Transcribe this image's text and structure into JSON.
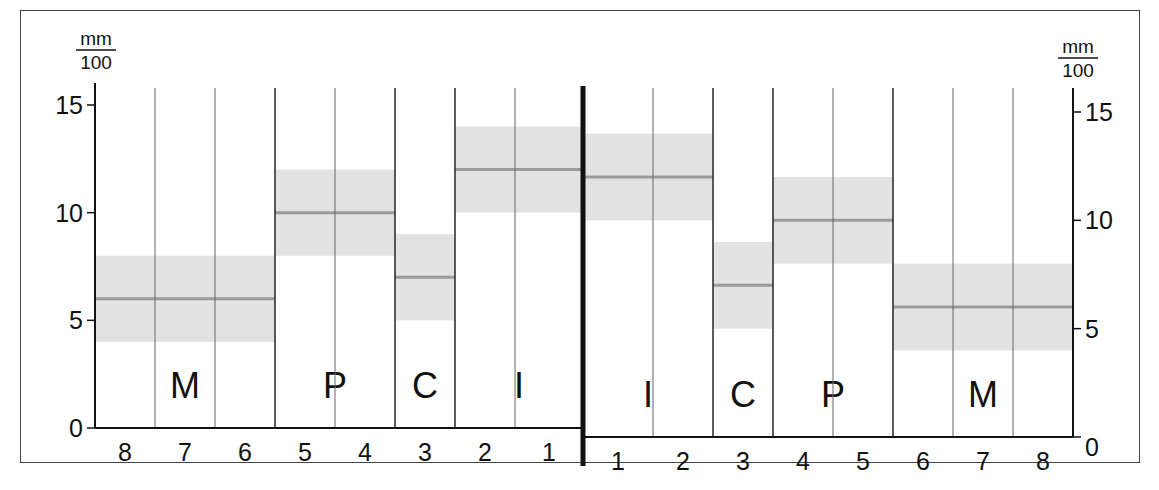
{
  "chart_data": {
    "type": "bar",
    "subtype": "range-band",
    "title": "",
    "ylabel": "mm/100",
    "ylabel_left": {
      "numerator": "mm",
      "denominator": "100"
    },
    "ylabel_right": {
      "numerator": "mm",
      "denominator": "100"
    },
    "xlabel": "",
    "ylim": [
      0,
      15
    ],
    "yticks": [
      0,
      5,
      10,
      15
    ],
    "grid": false,
    "legend": null,
    "divider": "thick vertical midline between left and right halves",
    "left_half": {
      "x_ticks": [
        "8",
        "7",
        "6",
        "5",
        "4",
        "3",
        "2",
        "1"
      ],
      "groups": [
        {
          "label": "M",
          "teeth": [
            "8",
            "7",
            "6"
          ],
          "min": 4,
          "mean": 6,
          "max": 8
        },
        {
          "label": "P",
          "teeth": [
            "5",
            "4"
          ],
          "min": 8,
          "mean": 10,
          "max": 12
        },
        {
          "label": "C",
          "teeth": [
            "3"
          ],
          "min": 5,
          "mean": 7,
          "max": 9
        },
        {
          "label": "I",
          "teeth": [
            "2",
            "1"
          ],
          "min": 10,
          "mean": 12,
          "max": 14
        }
      ]
    },
    "right_half": {
      "x_ticks": [
        "1",
        "2",
        "3",
        "4",
        "5",
        "6",
        "7",
        "8"
      ],
      "groups": [
        {
          "label": "I",
          "teeth": [
            "1",
            "2"
          ],
          "min": 10,
          "mean": 12,
          "max": 14
        },
        {
          "label": "C",
          "teeth": [
            "3"
          ],
          "min": 5,
          "mean": 7,
          "max": 9
        },
        {
          "label": "P",
          "teeth": [
            "4",
            "5"
          ],
          "min": 8,
          "mean": 10,
          "max": 12
        },
        {
          "label": "M",
          "teeth": [
            "6",
            "7",
            "8"
          ],
          "min": 4,
          "mean": 6,
          "max": 8
        }
      ]
    },
    "colors": {
      "band": "#e2e2e2",
      "mean_line": "#9a9a9a",
      "axis": "#111111",
      "group_divider": "#333333",
      "tooth_divider": "#666666"
    }
  }
}
